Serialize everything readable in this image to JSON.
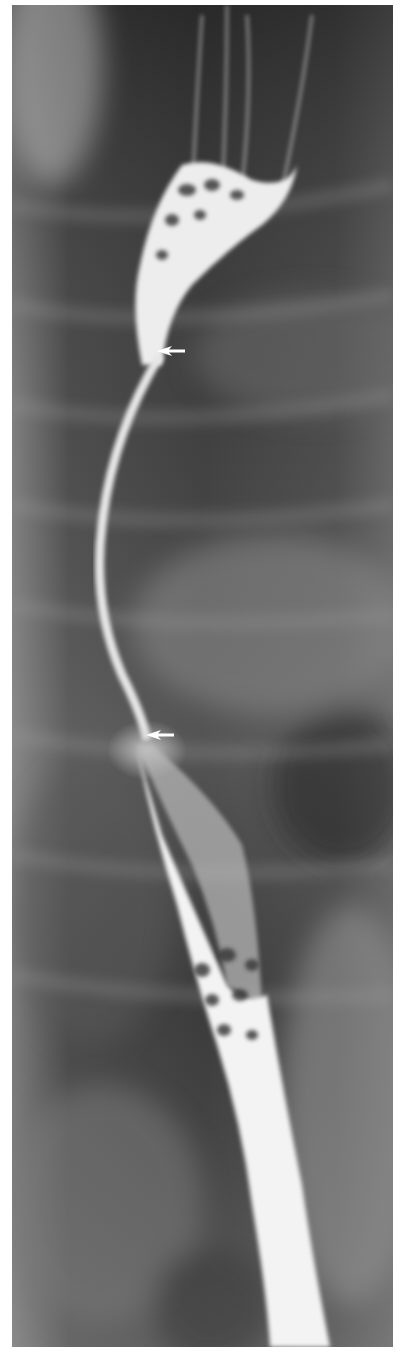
{
  "figure": {
    "type": "barium esophagram radiograph",
    "orientation": "portrait",
    "colors": {
      "background_page": "#ffffff",
      "dark_field": "#2a2a2a",
      "mid_field": "#6e6e6e",
      "contrast_column": "#f4f4f4",
      "arrow": "#ffffff"
    },
    "annotations": [
      {
        "name": "upper-arrow",
        "direction": "left",
        "x": 172,
        "y": 351
      },
      {
        "name": "lower-arrow",
        "direction": "left",
        "x": 160,
        "y": 735
      }
    ]
  }
}
